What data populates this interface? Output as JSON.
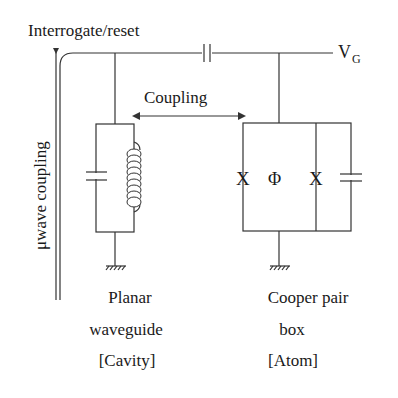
{
  "diagram": {
    "type": "circuit-schematic",
    "labels": {
      "interrogate": "Interrogate/reset",
      "vg_main": "V",
      "vg_sub": "G",
      "coupling": "Coupling",
      "uwave": "μwave coupling",
      "phi": "Φ",
      "junction_left": "X",
      "junction_right": "X"
    },
    "cavity_caption": [
      "Planar",
      "waveguide",
      "[Cavity]"
    ],
    "atom_caption": [
      "Cooper pair",
      "box",
      "[Atom]"
    ],
    "colors": {
      "line": "#333333",
      "text": "#1a1a1a",
      "background": "#ffffff"
    }
  }
}
